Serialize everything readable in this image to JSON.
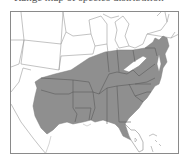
{
  "caption": "Range map of species distribution",
  "map": {
    "region": "Eastern United States",
    "highlighted_region": "Southeastern United States",
    "fill_color": "#8f8f8f",
    "border_color": "#5a5a5a",
    "background_color": "#ffffff",
    "frame_color": "#8a8a8a",
    "highlighted_states": [
      "Texas (east)",
      "Oklahoma",
      "Arkansas",
      "Louisiana",
      "Missouri (south)",
      "Kansas (southeast)",
      "Illinois (south)",
      "Indiana (south)",
      "Ohio (south)",
      "Kentucky",
      "Tennessee",
      "Mississippi",
      "Alabama",
      "Georgia",
      "Florida (north)",
      "South Carolina",
      "North Carolina",
      "Virginia",
      "West Virginia",
      "Maryland",
      "Delaware",
      "New Jersey (south)",
      "Pennsylvania (south)"
    ]
  }
}
